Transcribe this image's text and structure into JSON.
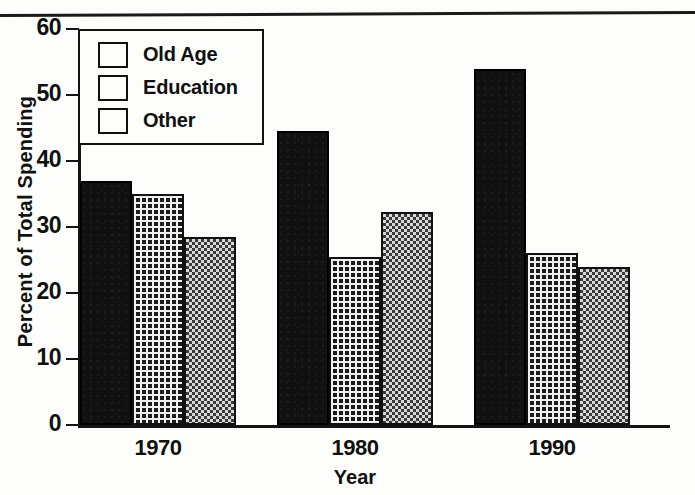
{
  "chart_data": {
    "type": "bar",
    "title": "",
    "xlabel": "Year",
    "ylabel": "Percent of Total Spending",
    "categories": [
      "1970",
      "1980",
      "1990"
    ],
    "ylim": [
      0,
      60
    ],
    "yticks": [
      0,
      10,
      20,
      30,
      40,
      50,
      60
    ],
    "ytick_labels": [
      "0",
      "10",
      "20",
      "30",
      "40",
      "50",
      "60"
    ],
    "grid": false,
    "legend_position": "upper-left-inside",
    "series": [
      {
        "name": "Old Age",
        "pattern": "solid-black",
        "color": "#111111",
        "values": [
          37.0,
          44.5,
          54.0
        ]
      },
      {
        "name": "Education",
        "pattern": "dark-crosshatch",
        "color": "#1b1b1b",
        "values": [
          35.0,
          25.5,
          26.0
        ]
      },
      {
        "name": "Other",
        "pattern": "light-checker",
        "color": "#bdbdbd",
        "values": [
          28.5,
          32.3,
          24.0
        ]
      }
    ]
  },
  "legend": {
    "items": [
      {
        "label": "Old Age"
      },
      {
        "label": "Education"
      },
      {
        "label": "Other"
      }
    ]
  },
  "axes": {
    "y_title": "Percent of Total Spending",
    "x_title": "Year"
  }
}
